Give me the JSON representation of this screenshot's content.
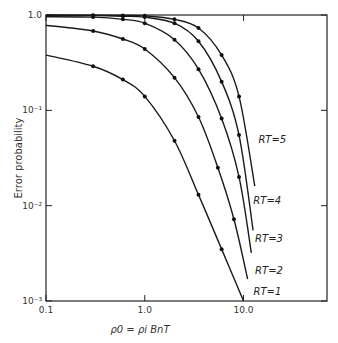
{
  "chart_data": {
    "type": "line",
    "title": "",
    "xlabel": "ρ0 = ρi BnT",
    "ylabel": "Error probability",
    "xscale": "log",
    "yscale": "log",
    "xlim": [
      0.1,
      70
    ],
    "ylim": [
      0.001,
      1.0
    ],
    "x_ticks": [
      {
        "value": 0.1,
        "label": "0.1"
      },
      {
        "value": 1.0,
        "label": "1.0"
      },
      {
        "value": 10.0,
        "label": "10.0"
      }
    ],
    "y_ticks": [
      {
        "value": 1.0,
        "label": "1.0"
      },
      {
        "value": 0.1,
        "label": "10⁻¹"
      },
      {
        "value": 0.01,
        "label": "10⁻²"
      },
      {
        "value": 0.001,
        "label": "10⁻³"
      }
    ],
    "grid": false,
    "legend": "inline-labels",
    "series": [
      {
        "name": "RT = 1",
        "label": "RT=1",
        "x": [
          0.1,
          0.3,
          0.6,
          1.0,
          2.0,
          3.5,
          6.0,
          10.0
        ],
        "y": [
          0.38,
          0.29,
          0.21,
          0.14,
          0.048,
          0.013,
          0.0035,
          0.001
        ]
      },
      {
        "name": "RT = 2",
        "label": "RT=2",
        "x": [
          0.1,
          0.3,
          0.6,
          1.0,
          2.0,
          3.5,
          5.5,
          8.0,
          11.0
        ],
        "y": [
          0.78,
          0.68,
          0.56,
          0.44,
          0.22,
          0.085,
          0.025,
          0.0072,
          0.0017
        ]
      },
      {
        "name": "RT = 3",
        "label": "RT=3",
        "x": [
          0.1,
          0.3,
          0.6,
          1.0,
          2.0,
          3.5,
          6.0,
          9.0,
          12.0
        ],
        "y": [
          0.96,
          0.95,
          0.9,
          0.82,
          0.55,
          0.27,
          0.082,
          0.02,
          0.0032
        ]
      },
      {
        "name": "RT = 4",
        "label": "RT=4",
        "x": [
          0.1,
          0.3,
          0.6,
          1.0,
          2.0,
          3.5,
          6.0,
          9.0,
          12.5
        ],
        "y": [
          0.99,
          0.985,
          0.97,
          0.95,
          0.82,
          0.53,
          0.2,
          0.055,
          0.0055
        ]
      },
      {
        "name": "RT = 5",
        "label": "RT=5",
        "x": [
          0.1,
          0.3,
          0.6,
          1.0,
          2.0,
          3.5,
          6.0,
          9.0,
          13.0
        ],
        "y": [
          1.0,
          0.995,
          0.99,
          0.98,
          0.9,
          0.73,
          0.38,
          0.14,
          0.016
        ]
      }
    ]
  }
}
